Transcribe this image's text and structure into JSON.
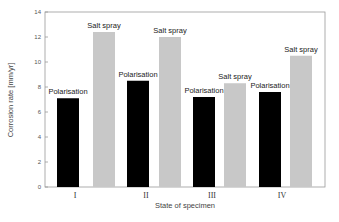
{
  "chart_data": {
    "type": "bar",
    "title": "",
    "xlabel": "State of specimen",
    "ylabel": "Corrosion rate [mm/yr]",
    "ylim": [
      0,
      14
    ],
    "yticks": [
      0,
      2,
      4,
      6,
      8,
      10,
      12,
      14
    ],
    "categories": [
      "I",
      "II",
      "III",
      "IV"
    ],
    "series": [
      {
        "name": "Polarisation",
        "color": "#000000",
        "values": [
          7.1,
          8.5,
          7.2,
          7.6
        ]
      },
      {
        "name": "Salt spray",
        "color": "#c8c8c8",
        "values": [
          12.4,
          12.0,
          8.3,
          10.5
        ]
      }
    ],
    "grid": false,
    "legend": "none (bars labeled directly)"
  }
}
